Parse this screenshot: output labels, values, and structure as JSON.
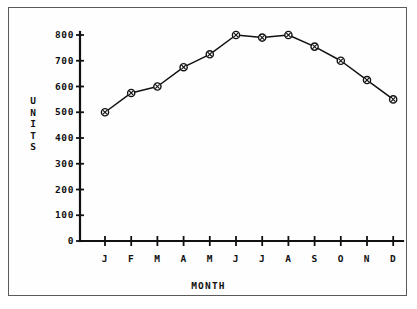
{
  "chart_data": {
    "type": "line",
    "title": "",
    "xlabel": "MONTH",
    "ylabel": "UNITS",
    "categories": [
      "J",
      "F",
      "M",
      "A",
      "M",
      "J",
      "J",
      "A",
      "S",
      "O",
      "N",
      "D"
    ],
    "values": [
      500,
      575,
      600,
      675,
      725,
      800,
      790,
      800,
      755,
      700,
      625,
      550
    ],
    "series": [
      {
        "name": "UNITS",
        "values": [
          500,
          575,
          600,
          675,
          725,
          800,
          790,
          800,
          755,
          700,
          625,
          550
        ]
      }
    ],
    "ylim": [
      0,
      800
    ],
    "yticks": [
      0,
      100,
      200,
      300,
      400,
      500,
      600,
      700,
      800
    ],
    "ytick_labels": [
      "0",
      "100",
      "200",
      "300",
      "400",
      "500",
      "600",
      "700",
      "800"
    ],
    "xtick_labels": [
      "J",
      "F",
      "M",
      "A",
      "M",
      "J",
      "J",
      "A",
      "S",
      "O",
      "N",
      "D"
    ],
    "grid": false,
    "legend": false,
    "legend_position": "none",
    "marker": "circle-with-cross",
    "line_color": "#111111",
    "marker_fill": "#ffffff",
    "background_color": "#ffffff",
    "frame_color": "#5a5a5a"
  },
  "axis": {
    "y_label_chars": [
      "U",
      "N",
      "I",
      "T",
      "S"
    ],
    "y_label": "UNITS",
    "x_label": "MONTH"
  }
}
